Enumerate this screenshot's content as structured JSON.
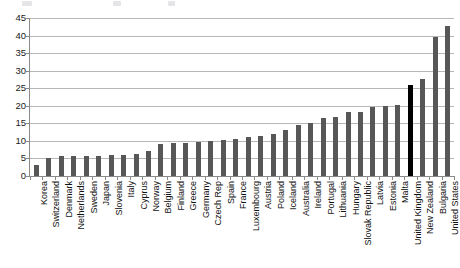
{
  "chart_data": {
    "type": "bar",
    "title": "",
    "subtitle": "",
    "xlabel": "",
    "ylabel": "",
    "ylim": [
      0,
      45
    ],
    "ytick_step": 5,
    "yticks": [
      0,
      5,
      10,
      15,
      20,
      25,
      30,
      35,
      40,
      45
    ],
    "grid": true,
    "legend": null,
    "orientation": "vertical",
    "sorted": "ascending",
    "bar_color": "#575757",
    "highlight_color": "#000000",
    "highlight_category": "United Kingdom",
    "categories": [
      "Korea",
      "Switzerland",
      "Denmark",
      "Netherlands",
      "Sweden",
      "Japan",
      "Slovenia",
      "Italy",
      "Cyprus",
      "Norway",
      "Belgium",
      "Finland",
      "Greece",
      "Germany",
      "Czech Rep",
      "Spain",
      "France",
      "Luxembourg",
      "Austria",
      "Poland",
      "Iceland",
      "Australia",
      "Ireland",
      "Portugal",
      "Lithuania",
      "Hungary",
      "Slovak Republic",
      "Latvia",
      "Estonia",
      "Malta",
      "United Kingdom",
      "New Zealand",
      "Bulgaria",
      "United States"
    ],
    "values": [
      3.0,
      5.2,
      5.6,
      5.6,
      5.7,
      5.8,
      5.9,
      6.0,
      6.2,
      7.0,
      9.2,
      9.3,
      9.4,
      9.7,
      10.0,
      10.4,
      10.6,
      11.0,
      11.4,
      12.0,
      13.0,
      14.6,
      15.0,
      16.6,
      16.8,
      18.2,
      18.3,
      19.7,
      20.0,
      20.2,
      25.8,
      27.6,
      39.5,
      42.8
    ]
  },
  "axis": {
    "y_tick_labels": [
      "45",
      "40",
      "35",
      "30",
      "25",
      "20",
      "15",
      "10",
      "5",
      "0"
    ]
  }
}
